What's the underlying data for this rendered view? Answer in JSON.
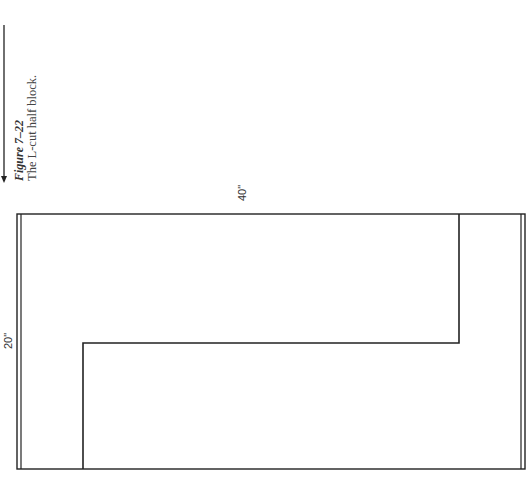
{
  "figure": {
    "number_label": "Figure 7–22",
    "caption": "The L-cut half block."
  },
  "diagram": {
    "width_label": "40\"",
    "height_label": "20\"",
    "line_color": "#222222",
    "shape": "L-shaped cut within a rectangular half block"
  }
}
